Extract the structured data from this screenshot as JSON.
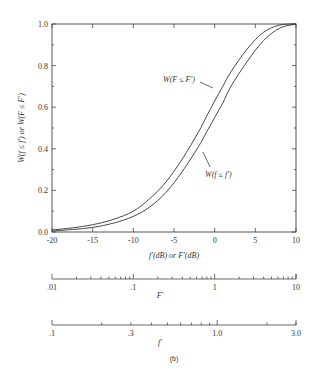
{
  "chart_data": {
    "type": "line",
    "title": "",
    "caption": "(b)",
    "xlabel": "f'(dB) or F'(dB)",
    "ylabel": "W(f ≤ f') or W(F ≤ F')",
    "xlim": [
      -20,
      10
    ],
    "ylim": [
      0,
      1.0
    ],
    "grid": false,
    "x_ticks": [
      -20,
      -15,
      -10,
      -5,
      0,
      5,
      10
    ],
    "x_tick_labels": [
      "-20",
      "-15",
      "-10",
      "-5",
      "0",
      "5",
      "10"
    ],
    "y_ticks": [
      0,
      0.2,
      0.4,
      0.6,
      0.8,
      1.0
    ],
    "y_tick_labels": [
      "0.0",
      "0.2",
      "0.4",
      "0.6",
      "0.8",
      "1.0"
    ],
    "series": [
      {
        "name": "W(F ≤ F')",
        "x": [
          -20,
          -17.5,
          -15,
          -12.5,
          -10,
          -8,
          -6,
          -4,
          -2,
          -1,
          0,
          1,
          2,
          4,
          6,
          8,
          10
        ],
        "y": [
          0.01,
          0.02,
          0.035,
          0.06,
          0.1,
          0.16,
          0.24,
          0.35,
          0.48,
          0.555,
          0.63,
          0.7,
          0.77,
          0.88,
          0.96,
          0.995,
          1.0
        ]
      },
      {
        "name": "W(f ≤ f')",
        "x": [
          -20,
          -17.5,
          -15,
          -12.5,
          -10,
          -8,
          -6,
          -4,
          -2,
          -1,
          0,
          1,
          2,
          4,
          6,
          8,
          10
        ],
        "y": [
          0.005,
          0.012,
          0.022,
          0.042,
          0.075,
          0.12,
          0.19,
          0.29,
          0.41,
          0.48,
          0.55,
          0.62,
          0.7,
          0.82,
          0.92,
          0.98,
          1.0
        ]
      }
    ],
    "annotations": [
      {
        "text": "W(F ≤ F')",
        "points_to": "W(F ≤ F')",
        "position": "upper-left of curves"
      },
      {
        "text": "W(f ≤ f')",
        "points_to": "W(f ≤ f')",
        "position": "lower-right of curves"
      }
    ],
    "secondary_axes": [
      {
        "label": "F'",
        "scale": "log",
        "range": [
          0.01,
          10
        ],
        "tick_labels": [
          ".01",
          ".1",
          "1",
          "10"
        ]
      },
      {
        "label": "f'",
        "scale": "log",
        "range": [
          0.1,
          3.0
        ],
        "tick_labels": [
          ".1",
          ".3",
          "1.0",
          "3.0"
        ]
      }
    ]
  },
  "labels": {
    "ylabel": "W(f ≤ f′)  or  W(F ≤ F′)",
    "xlabel": "f′(dB) or F′(dB)",
    "annot_upper": "W(F ≤ F′)",
    "annot_lower": "W(f ≤ f′)",
    "axis_F": "F′",
    "axis_f": "f′",
    "caption": "(b)"
  }
}
